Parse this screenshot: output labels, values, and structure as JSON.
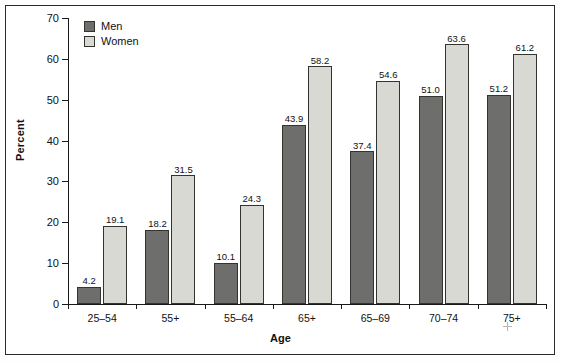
{
  "chart_data": {
    "type": "bar",
    "title": "",
    "xlabel": "Age",
    "ylabel": "Percent",
    "ylim": [
      0,
      70
    ],
    "yticks": [
      0,
      10,
      20,
      30,
      40,
      50,
      60,
      70
    ],
    "ytick_labels": [
      "0",
      "10",
      "20",
      "30",
      "40",
      "50",
      "60",
      "70"
    ],
    "grid": false,
    "legend_position": "top-left",
    "categories": [
      "25–54",
      "55+",
      "55–64",
      "65+",
      "65–69",
      "70–74",
      "75+"
    ],
    "series": [
      {
        "name": "Men",
        "color": "#6e6e6c",
        "values": [
          4.2,
          18.2,
          10.1,
          43.9,
          37.4,
          51.0,
          51.2
        ],
        "labels": [
          "4.2",
          "18.2",
          "10.1",
          "43.9",
          "37.4",
          "51.0",
          "51.2"
        ]
      },
      {
        "name": "Women",
        "color": "#d9d9d4",
        "values": [
          19.1,
          31.5,
          24.3,
          58.2,
          54.6,
          63.6,
          61.2
        ],
        "labels": [
          "19.1",
          "31.5",
          "24.3",
          "58.2",
          "54.6",
          "63.6",
          "61.2"
        ]
      }
    ]
  },
  "legend": {
    "items": [
      {
        "label": "Men",
        "swatch": "men"
      },
      {
        "label": "Women",
        "swatch": "women"
      }
    ]
  },
  "axes": {
    "y_title": "Percent",
    "x_title": "Age"
  }
}
